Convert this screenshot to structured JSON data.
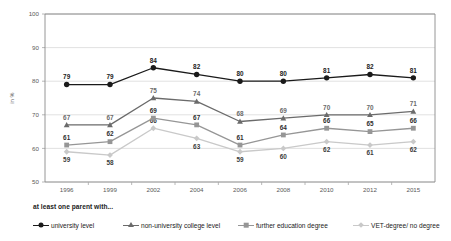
{
  "chart_data": {
    "type": "line",
    "title": "",
    "xlabel": "",
    "ylabel": "in %",
    "ylim": [
      50,
      100
    ],
    "yticks": [
      50,
      60,
      70,
      80,
      90,
      100
    ],
    "grid": true,
    "legend_position": "bottom",
    "legend_title": "at least one parent with...",
    "categories": [
      "1996",
      "1999",
      "2002",
      "2004",
      "2006",
      "2008",
      "2010",
      "2012",
      "2015"
    ],
    "series": [
      {
        "name": "university level",
        "marker": "circle",
        "color": "#1a1a1a",
        "values": [
          79,
          79,
          84,
          82,
          80,
          80,
          81,
          82,
          81
        ],
        "label_positions": [
          "above",
          "above",
          "above",
          "above",
          "above",
          "above",
          "above",
          "above",
          "above"
        ]
      },
      {
        "name": "non-university college level",
        "marker": "triangle",
        "color": "#6b6b6b",
        "values": [
          67,
          67,
          75,
          74,
          68,
          69,
          70,
          70,
          71
        ],
        "label_positions": [
          "above",
          "above",
          "above",
          "above",
          "above",
          "above",
          "above",
          "above",
          "above"
        ]
      },
      {
        "name": "further education degree",
        "marker": "square",
        "color": "#969696",
        "values": [
          61,
          62,
          69,
          67,
          61,
          64,
          66,
          65,
          66
        ],
        "label_positions": [
          "above",
          "above",
          "above",
          "above",
          "above",
          "above",
          "above",
          "above",
          "above"
        ]
      },
      {
        "name": "VET-degree/ no degree",
        "marker": "diamond",
        "color": "#c9c9c9",
        "values": [
          59,
          58,
          66,
          63,
          59,
          60,
          62,
          61,
          62
        ],
        "label_positions": [
          "below",
          "below",
          "above",
          "below",
          "below",
          "below",
          "below",
          "below",
          "below"
        ]
      }
    ]
  },
  "colors": {
    "grid": "#d9d9d9",
    "axis": "#a6a6a6",
    "text": "#3b3b3b",
    "background": "#ffffff"
  }
}
